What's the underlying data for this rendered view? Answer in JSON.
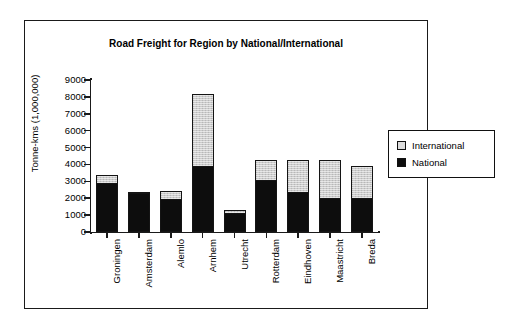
{
  "chart_data": {
    "type": "bar",
    "stacked": true,
    "title": "Road Freight for Region by National/International",
    "xlabel": "",
    "ylabel": "Tonne-kms (1,000,000)",
    "ylim": [
      0,
      9000
    ],
    "ytick_step": 1000,
    "ytick_labels": [
      "9000",
      "8000",
      "7000",
      "6000",
      "5000",
      "4000",
      "3000",
      "2000",
      "1000",
      "0"
    ],
    "grid": false,
    "legend_position": "right",
    "categories": [
      "Groningen",
      "Amsterdam",
      "Alemlo",
      "Arnhem",
      "Utrecht",
      "Rotterdam",
      "Eindhoven",
      "Maastricht",
      "Breda"
    ],
    "series": [
      {
        "name": "National",
        "color": "#0d0d0d",
        "values": [
          2850,
          2250,
          1900,
          3850,
          1050,
          3000,
          2300,
          1950,
          1950
        ]
      },
      {
        "name": "International",
        "color": "#cbcbcb",
        "values": [
          550,
          100,
          550,
          4350,
          250,
          1250,
          1950,
          2300,
          1950
        ]
      }
    ],
    "totals": [
      3400,
      2350,
      2450,
      8200,
      1300,
      4250,
      4250,
      4250,
      3900
    ]
  },
  "legend": {
    "items": [
      {
        "label": "International",
        "swatch": "international-swatch"
      },
      {
        "label": "National",
        "swatch": "national-swatch"
      }
    ]
  }
}
